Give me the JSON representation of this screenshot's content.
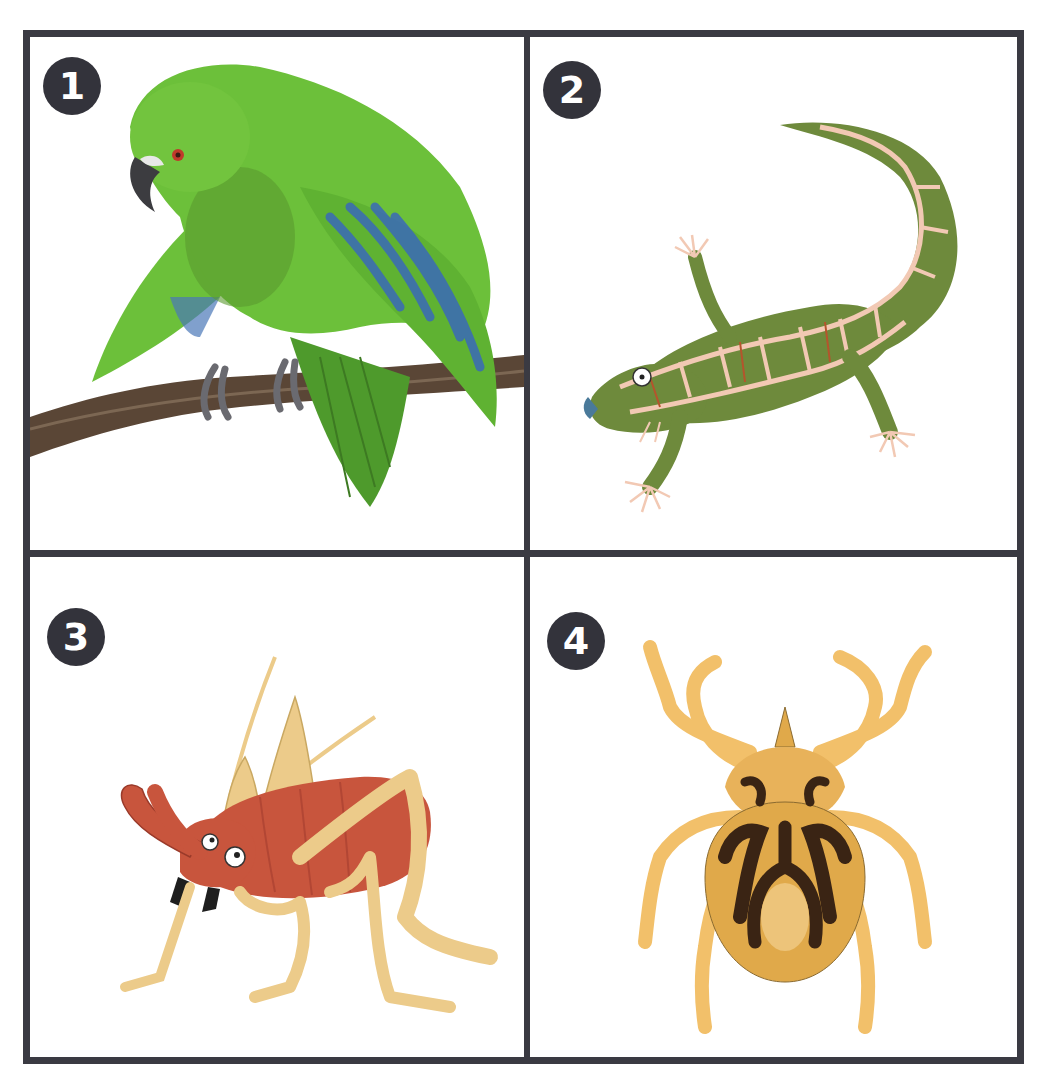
{
  "caption": {
    "text": "",
    "note": "partially cropped text at top edge, illegible"
  },
  "panels": [
    {
      "number": "1",
      "subject": "green-parrot-on-branch",
      "colors": {
        "body": "#6cc03a",
        "wing_blue": "#3a68b8",
        "branch": "#5a4636",
        "eye": "#c0392b"
      }
    },
    {
      "number": "2",
      "subject": "patterned-green-gecko",
      "colors": {
        "body": "#6e8a3c",
        "pattern": "#f2c9b4",
        "accent": "#b5542c",
        "snout": "#4a7a9a"
      }
    },
    {
      "number": "3",
      "subject": "red-tusked-weta-insect",
      "colors": {
        "body": "#c8553d",
        "legs": "#eccb8a",
        "mandible": "#1e1e1e"
      }
    },
    {
      "number": "4",
      "subject": "yellow-tick-with-dark-markings",
      "colors": {
        "body": "#e0a94a",
        "legs": "#f2c06a",
        "markings": "#3a2414"
      }
    }
  ],
  "style": {
    "border_color": "#3a3a42",
    "badge_color": "#33333b",
    "badge_text_color": "#ffffff",
    "background": "#ffffff"
  }
}
